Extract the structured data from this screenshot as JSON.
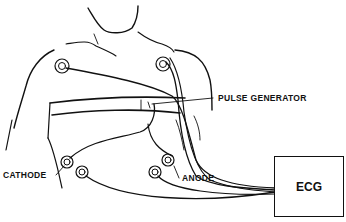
{
  "diagram": {
    "labels": {
      "pulse_generator": "PULSE GENERATOR",
      "cathode": "CATHODE",
      "anode": "ANODE",
      "ecg": "ECG"
    },
    "colors": {
      "line": "#111111",
      "background": "#ffffff"
    }
  }
}
